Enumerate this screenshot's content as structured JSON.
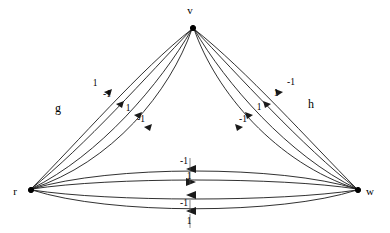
{
  "figure": {
    "type": "directed-multigraph",
    "background_color": "#ffffff",
    "stroke_color": "#1a1a1a",
    "width": 390,
    "height": 233
  },
  "vertices": [
    {
      "id": "v",
      "label": "v",
      "x": 193,
      "y": 28,
      "label_x": 190,
      "label_y": 14
    },
    {
      "id": "r",
      "label": "r",
      "x": 31,
      "y": 190,
      "label_x": 13,
      "label_y": 195
    },
    {
      "id": "w",
      "label": "w",
      "x": 358,
      "y": 190,
      "label_x": 366,
      "label_y": 195
    }
  ],
  "bundles": [
    {
      "name": "g",
      "label": "g",
      "label_x": 58,
      "label_y": 112,
      "from": "v",
      "to": "r",
      "edge_count": 4,
      "edges": [
        {
          "weight": "1",
          "label_x": 95,
          "label_y": 86
        },
        {
          "weight": "-1",
          "label_x": 105,
          "label_y": 96
        },
        {
          "weight": "1",
          "label_x": 126,
          "label_y": 110
        },
        {
          "weight": "-1",
          "label_x": 137,
          "label_y": 120
        }
      ]
    },
    {
      "name": "h",
      "label": "h",
      "label_x": 311,
      "label_y": 108,
      "from": "v",
      "to": "w",
      "edge_count": 4,
      "edges": [
        {
          "weight": "-1",
          "label_x": 290,
          "label_y": 85
        },
        {
          "weight": "1",
          "label_x": 276,
          "label_y": 95
        },
        {
          "weight": "1",
          "label_x": 259,
          "label_y": 110
        },
        {
          "weight": "-1",
          "label_x": 243,
          "label_y": 121
        }
      ]
    },
    {
      "name": "base",
      "label": "",
      "label_x": 0,
      "label_y": 0,
      "from": "w",
      "to": "r",
      "edge_count": 4,
      "edges": [
        {
          "weight": "-1",
          "label_x": 182,
          "label_y": 165,
          "direction": "left"
        },
        {
          "weight": "1",
          "label_x": 186,
          "label_y": 180,
          "direction": "right"
        },
        {
          "weight": "-1",
          "label_x": 182,
          "label_y": 207,
          "direction": "left"
        },
        {
          "weight": "1",
          "label_x": 186,
          "label_y": 222,
          "direction": "left"
        }
      ]
    }
  ]
}
